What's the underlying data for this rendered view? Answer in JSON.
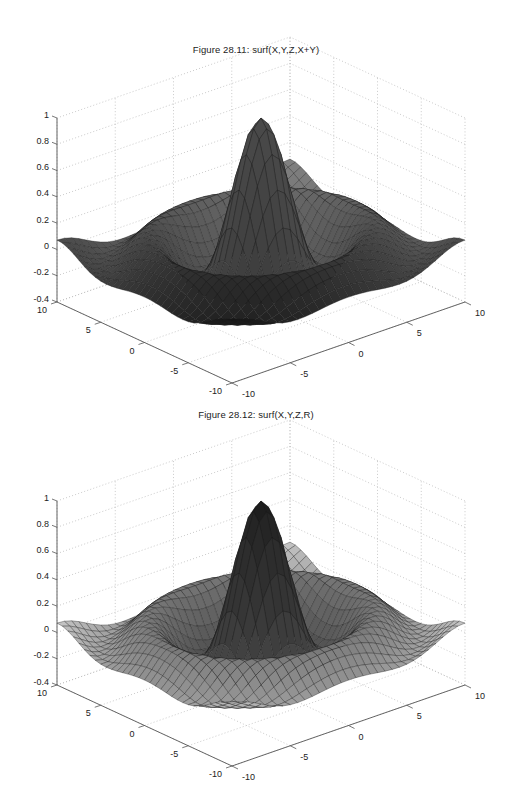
{
  "figures": [
    {
      "title": "Figure 28.11: surf(X,Y,Z,X+Y)",
      "color_mode": "X+Y"
    },
    {
      "title": "Figure 28.12: surf(X,Y,Z,R)",
      "color_mode": "R"
    }
  ],
  "chart_data": [
    {
      "type": "surface",
      "title": "Figure 28.11: surf(X,Y,Z,X+Y)",
      "function": "Z = sin(R)/R, R = sqrt(X^2 + Y^2) (sinc / sombrero)",
      "color_data": "X+Y",
      "colormap": "gray",
      "xlabel": "",
      "ylabel": "",
      "zlabel": "",
      "xlim": [
        -10,
        10
      ],
      "ylim": [
        -10,
        10
      ],
      "zlim": [
        -0.4,
        1
      ],
      "x_ticks": [
        -10,
        -5,
        0,
        5,
        10
      ],
      "y_ticks": [
        -10,
        -5,
        0,
        5,
        10
      ],
      "z_ticks": [
        -0.4,
        -0.2,
        0,
        0.2,
        0.4,
        0.6,
        0.8,
        1
      ],
      "grid": true,
      "mesh_size": [
        33,
        33
      ],
      "peak": {
        "x": 0,
        "y": 0,
        "z": 1
      },
      "min_z": -0.22
    },
    {
      "type": "surface",
      "title": "Figure 28.12: surf(X,Y,Z,R)",
      "function": "Z = sin(R)/R, R = sqrt(X^2 + Y^2) (sinc / sombrero)",
      "color_data": "R",
      "colormap": "gray",
      "xlabel": "",
      "ylabel": "",
      "zlabel": "",
      "xlim": [
        -10,
        10
      ],
      "ylim": [
        -10,
        10
      ],
      "zlim": [
        -0.4,
        1
      ],
      "x_ticks": [
        -10,
        -5,
        0,
        5,
        10
      ],
      "y_ticks": [
        -10,
        -5,
        0,
        5,
        10
      ],
      "z_ticks": [
        -0.4,
        -0.2,
        0,
        0.2,
        0.4,
        0.6,
        0.8,
        1
      ],
      "grid": true,
      "mesh_size": [
        33,
        33
      ],
      "peak": {
        "x": 0,
        "y": 0,
        "z": 1
      },
      "min_z": -0.22
    }
  ],
  "axes": {
    "z_tick_labels": [
      "1",
      "0.8",
      "0.6",
      "0.4",
      "0.2",
      "0",
      "-0.2",
      "-0.4"
    ],
    "y_tick_labels": [
      "10",
      "5",
      "0",
      "-5",
      "-10"
    ],
    "x_tick_labels": [
      "-10",
      "-5",
      "0",
      "5",
      "10"
    ]
  }
}
